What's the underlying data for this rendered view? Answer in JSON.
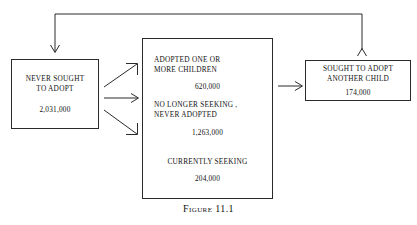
{
  "figure": {
    "caption": "Figure 11.1",
    "background_color": "#ffffff",
    "line_color": "#2a2a2a",
    "text_color": "#111111"
  },
  "nodes": {
    "never_sought": {
      "label": "NEVER SOUGHT\nTO ADOPT",
      "value": "2,031,000"
    },
    "sought_another": {
      "label": "SOUGHT TO ADOPT\nANOTHER CHILD",
      "value": "174,000"
    },
    "outcomes": [
      {
        "label": "ADOPTED ONE OR\nMORE CHILDREN",
        "value": "620,000",
        "align": "left"
      },
      {
        "label": "NO LONGER SEEKING ,\nNEVER ADOPTED",
        "value": "1,263,000",
        "align": "left"
      },
      {
        "label": "CURRENTLY SEEKING",
        "value": "204,000",
        "align": "centered"
      }
    ]
  },
  "connectors": [
    {
      "name": "never-sought-to-adopted",
      "kind": "diagonal-arrow-up-right",
      "from": "never_sought",
      "to": "outcomes"
    },
    {
      "name": "never-sought-to-no-longer-seeking",
      "kind": "horizontal-arrow-right",
      "from": "never_sought",
      "to": "outcomes"
    },
    {
      "name": "never-sought-to-currently-seeking",
      "kind": "diagonal-arrow-down-right",
      "from": "never_sought",
      "to": "outcomes"
    },
    {
      "name": "adopted-to-sought-another",
      "kind": "horizontal-arrow-right",
      "from": "outcomes",
      "to": "sought_another"
    },
    {
      "name": "sought-another-feedback-loop",
      "kind": "elbow-arrow-loop",
      "from": "sought_another",
      "to": "never_sought"
    }
  ]
}
